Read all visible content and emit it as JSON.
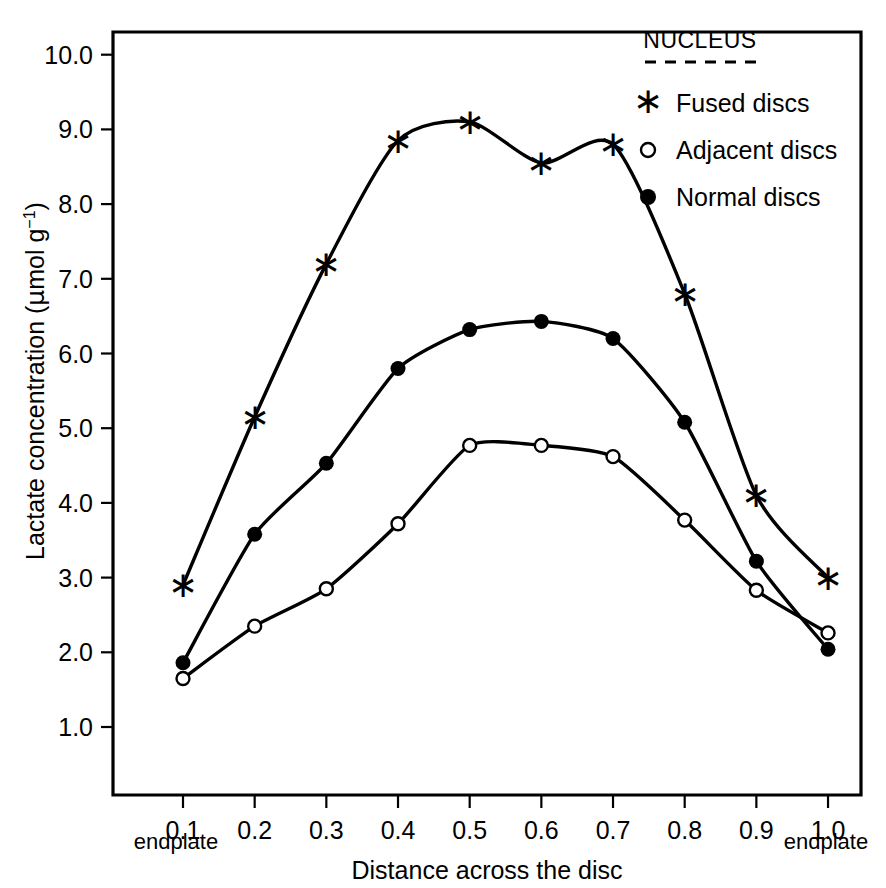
{
  "chart_data": {
    "type": "line",
    "title": "",
    "xlabel": "Distance across the disc",
    "ylabel": "Lactate concentration (μmol g⁻¹)",
    "x": [
      0.1,
      0.2,
      0.3,
      0.4,
      0.5,
      0.6,
      0.7,
      0.8,
      0.9,
      1.0
    ],
    "xtick_labels": [
      "0.1",
      "0.2",
      "0.3",
      "0.4",
      "0.5",
      "0.6",
      "0.7",
      "0.8",
      "0.9",
      "1.0"
    ],
    "ytick_labels": [
      "10.0",
      "9.0",
      "8.0",
      "7.0",
      "6.0",
      "5.0",
      "4.0",
      "3.0",
      "2.0",
      "1.0"
    ],
    "ytick_values": [
      10.0,
      9.0,
      8.0,
      7.0,
      6.0,
      5.0,
      4.0,
      3.0,
      2.0,
      1.0
    ],
    "xlim": [
      0.04,
      1.05
    ],
    "ylim": [
      0.25,
      10.5
    ],
    "grid": false,
    "legend_position": "top-right",
    "series": [
      {
        "name": "Fused discs",
        "marker": "asterisk",
        "values": [
          2.9,
          5.15,
          7.2,
          8.85,
          9.1,
          8.55,
          8.8,
          6.8,
          4.1,
          3.0
        ]
      },
      {
        "name": "Adjacent discs",
        "marker": "open-circle",
        "values": [
          1.65,
          2.35,
          2.85,
          3.72,
          4.77,
          4.77,
          4.62,
          3.77,
          2.83,
          2.26
        ]
      },
      {
        "name": "Normal discs",
        "marker": "filled-circle",
        "values": [
          1.86,
          3.58,
          4.53,
          5.8,
          6.32,
          6.43,
          6.2,
          5.08,
          3.22,
          2.04
        ]
      }
    ]
  },
  "legend": {
    "title": "NUCLEUS",
    "entries": [
      {
        "label": "Fused discs",
        "marker": "asterisk"
      },
      {
        "label": "Adjacent discs",
        "marker": "open-circle"
      },
      {
        "label": "Normal discs",
        "marker": "filled-circle"
      }
    ]
  },
  "axes": {
    "x_left_note": "endplate",
    "x_right_note": "endplate",
    "x_title": "Distance across the disc",
    "y_title_parts": {
      "main": "Lactate concentration (",
      "mu": "μ",
      "unit": "mol g",
      "exponent": "−1",
      "close": ")"
    }
  }
}
